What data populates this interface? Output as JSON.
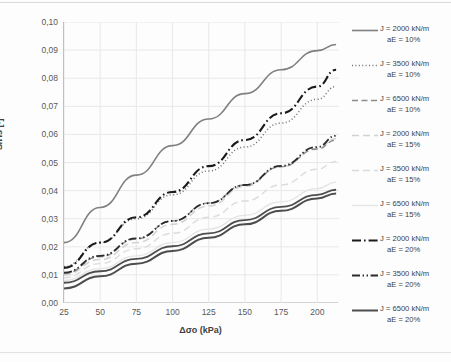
{
  "chart_data": {
    "type": "line",
    "title": "",
    "xlabel": "Δσo (kPa)",
    "ylabel": "S/Hs [-]",
    "xlim": [
      25,
      215
    ],
    "ylim": [
      0.0,
      0.1
    ],
    "xticks": [
      "25",
      "50",
      "75",
      "100",
      "125",
      "150",
      "175",
      "200"
    ],
    "xtick_values": [
      25,
      50,
      75,
      100,
      125,
      150,
      175,
      200
    ],
    "yticks": [
      "0,00",
      "0,01",
      "0,02",
      "0,03",
      "0,04",
      "0,05",
      "0,06",
      "0,07",
      "0,08",
      "0,09",
      "0,10"
    ],
    "ytick_values": [
      0.0,
      0.01,
      0.02,
      0.03,
      0.04,
      0.05,
      0.06,
      0.07,
      0.08,
      0.09,
      0.1
    ],
    "grid": true,
    "legend_position": "right",
    "x": [
      25,
      50,
      75,
      100,
      125,
      150,
      175,
      200,
      213
    ],
    "series": [
      {
        "name": "J = 2000 kN/m  aE = 10%",
        "label_line1": "J = 2000 kN/m",
        "label_line2": "aE = 10%",
        "J": 2000,
        "aE": "10%",
        "style": "solid",
        "color": "#808080",
        "width": 1.6,
        "values": [
          0.0215,
          0.034,
          0.0455,
          0.056,
          0.0655,
          0.0745,
          0.083,
          0.0898,
          0.092
        ]
      },
      {
        "name": "J = 3500 kN/m  aE = 10%",
        "label_line1": "J = 3500 kN/m",
        "label_line2": "aE = 10%",
        "J": 3500,
        "aE": "10%",
        "style": "dotted",
        "color": "#707070",
        "width": 1.5,
        "values": [
          0.013,
          0.0215,
          0.03,
          0.0385,
          0.047,
          0.0555,
          0.064,
          0.0725,
          0.077
        ]
      },
      {
        "name": "J = 6500 kN/m  aE = 10%",
        "label_line1": "J = 6500 kN/m",
        "label_line2": "aE = 10%",
        "J": 6500,
        "aE": "10%",
        "style": "dashed",
        "color": "#8c8c8c",
        "width": 1.4,
        "values": [
          0.0105,
          0.0165,
          0.0228,
          0.0292,
          0.0356,
          0.042,
          0.0485,
          0.0548,
          0.058
        ]
      },
      {
        "name": "J = 2000 kN/m  aE = 15%",
        "label_line1": "J = 2000 kN/m",
        "label_line2": "aE = 15%",
        "J": 2000,
        "aE": "15%",
        "style": "dashed-light",
        "color": "#d2d2d2",
        "width": 1.5,
        "values": [
          0.01,
          0.0155,
          0.0215,
          0.028,
          0.0345,
          0.0415,
          0.0485,
          0.055,
          0.0585
        ]
      },
      {
        "name": "J = 3500 kN/m  aE = 15%",
        "label_line1": "J = 3500 kN/m",
        "label_line2": "aE = 15%",
        "J": 3500,
        "aE": "15%",
        "style": "dashed-light2",
        "color": "#dcdcdc",
        "width": 1.4,
        "values": [
          0.009,
          0.014,
          0.0193,
          0.0248,
          0.0305,
          0.0363,
          0.042,
          0.0476,
          0.0504
        ]
      },
      {
        "name": "J = 6500 kN/m  aE = 15%",
        "label_line1": "J = 6500 kN/m",
        "label_line2": "aE = 15%",
        "J": 6500,
        "aE": "15%",
        "style": "solid-light",
        "color": "#e4e4e4",
        "width": 1.3,
        "values": [
          0.008,
          0.0122,
          0.0168,
          0.0215,
          0.0263,
          0.0312,
          0.036,
          0.0407,
          0.043
        ]
      },
      {
        "name": "J = 2000 kN/m  aE = 20%",
        "label_line1": "J = 2000 kN/m",
        "label_line2": "aE = 20%",
        "J": 2000,
        "aE": "20%",
        "style": "dashdot-thick",
        "color": "#1a1a1a",
        "width": 2.1,
        "values": [
          0.0125,
          0.0215,
          0.0305,
          0.0395,
          0.0487,
          0.058,
          0.0675,
          0.077,
          0.083
        ]
      },
      {
        "name": "J = 3500 kN/m  aE = 20%",
        "label_line1": "J = 3500 kN/m",
        "label_line2": "aE = 20%",
        "J": 3500,
        "aE": "20%",
        "style": "dashdotdot",
        "color": "#2b2b2b",
        "width": 1.8,
        "values": [
          0.0108,
          0.0168,
          0.023,
          0.0292,
          0.0355,
          0.042,
          0.0488,
          0.0555,
          0.0595
        ]
      },
      {
        "name": "J = 6500 kN/m  aE = 20%",
        "label_line1": "J = 6500 kN/m",
        "label_line2": "aE = 20%",
        "J": 6500,
        "aE": "20%",
        "style": "solid-thick",
        "color": "#4d4d4d",
        "width": 2.0,
        "values": [
          0.0052,
          0.0095,
          0.014,
          0.0185,
          0.0232,
          0.028,
          0.0328,
          0.0372,
          0.039
        ]
      }
    ],
    "second_solid_thick": {
      "name": "J = 6500 kN/m  aE = 20% (upper)",
      "style": "solid-thick",
      "color": "#4d4d4d",
      "width": 1.8,
      "values": [
        0.0072,
        0.0113,
        0.0157,
        0.0202,
        0.0248,
        0.0295,
        0.0342,
        0.0385,
        0.0403
      ]
    }
  }
}
